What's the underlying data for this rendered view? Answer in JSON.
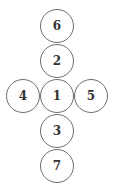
{
  "diagram": {
    "type": "cross-arrangement-of-numbered-circles",
    "stroke_color": "#6e6e6e",
    "text_color": "#333333",
    "nodes": [
      {
        "label": "6",
        "cx": 57,
        "cy": 26
      },
      {
        "label": "2",
        "cx": 57,
        "cy": 61
      },
      {
        "label": "4",
        "cx": 23,
        "cy": 96
      },
      {
        "label": "1",
        "cx": 57,
        "cy": 96
      },
      {
        "label": "5",
        "cx": 91,
        "cy": 96
      },
      {
        "label": "3",
        "cx": 57,
        "cy": 131
      },
      {
        "label": "7",
        "cx": 57,
        "cy": 166
      }
    ]
  }
}
